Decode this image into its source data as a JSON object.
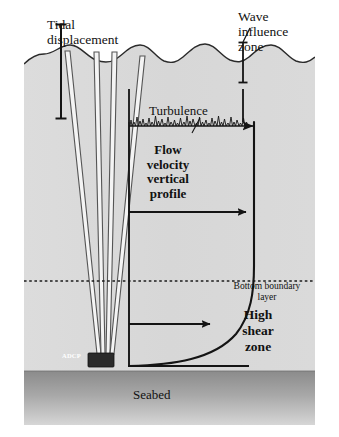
{
  "figure": {
    "labels": {
      "tidal_displacement": "Tidal\ndisplacement",
      "wave_influence_zone": "Wave\ninfluence\nzone",
      "turbulence": "Turbulence",
      "flow_velocity_profile": "Flow\nvelocity\nvertical\nprofile",
      "bottom_boundary_layer": "Bottom boundary\nlayer",
      "high_shear_zone": "High\nshear\nzone",
      "seabed": "Seabed",
      "adcp": "ADCP"
    },
    "colors": {
      "water": "#d9d9d9",
      "water_edge": "#c9c9c9",
      "seabed_top": "#8e8e8e",
      "seabed_bottom": "#d2d2d2",
      "ink": "#1a1a1a",
      "beam_fill": "#f2f2f2",
      "beam_stroke": "#4a4a4a",
      "adcp_body": "#2b2b2b",
      "background": "#ffffff"
    },
    "elements": {
      "water_surface": "wavy-line-5-crests",
      "tidal_bracket": "vertical-bracket-left",
      "wave_bracket": "vertical-bracket-right",
      "bbl_line": "horizontal-dashed-line",
      "adcp_beams": 4,
      "velocity_arrows": 3,
      "turbulence_arrow": "noisy-horizontal-arrow"
    }
  }
}
